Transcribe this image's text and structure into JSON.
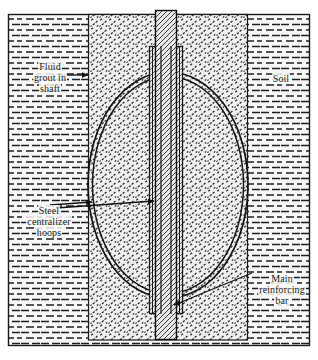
{
  "figure": {
    "width": 318,
    "height": 360,
    "background_color": "#ffffff",
    "line_color": "#1a1a1a",
    "soil_fill_color": "#f2f2f2",
    "grout_fill_color": "#ebebeb",
    "rebar_fill_color": "#e4e4e4"
  },
  "labels": {
    "fluid_grout": "Fluid\ngrout in\nshaft",
    "soil": "Soil",
    "steel_hoops": "Steel\ncentralizer\nhoops",
    "main_bar": "Main\nreinforcing\nbar"
  },
  "regions": {
    "soil": {
      "name": "Soil",
      "hatch": "brick-dash",
      "outer_box": {
        "x": 8,
        "y": 14,
        "width": 302,
        "height": 332
      }
    },
    "grout_shaft": {
      "name": "Fluid grout in shaft",
      "hatch": "stipple-dot",
      "box": {
        "x": 88,
        "y": 14,
        "width": 160,
        "height": 326
      }
    },
    "centralizer_hoops": {
      "name": "Steel centralizer hoops",
      "shape": "ellipse-ring",
      "center_x": 168,
      "center_y": 185,
      "outer_rx": 80,
      "outer_ry": 113,
      "inner_rx": 75,
      "inner_ry": 108
    },
    "main_reinforcing_bar": {
      "name": "Main reinforcing bar",
      "hatch": "diagonal",
      "bar_box": {
        "x": 155,
        "y": 10,
        "width": 22,
        "height": 330
      },
      "cage_box": {
        "x": 149,
        "y": 46,
        "width": 34,
        "height": 268
      }
    }
  },
  "leaders": [
    {
      "name": "fluid-grout-leader",
      "from_label": "fluid_grout",
      "to_region": "grout_shaft",
      "arrow": "right"
    },
    {
      "name": "steel-hoops-leader-ellipse",
      "from_label": "steel_hoops",
      "to_region": "centralizer_hoops",
      "arrow": "right"
    },
    {
      "name": "steel-hoops-leader-bar",
      "from_label": "steel_hoops",
      "to_region": "main_reinforcing_bar",
      "arrow": "right"
    },
    {
      "name": "main-bar-leader",
      "from_label": "main_bar",
      "to_region": "main_reinforcing_bar",
      "arrow": "down-left"
    }
  ]
}
